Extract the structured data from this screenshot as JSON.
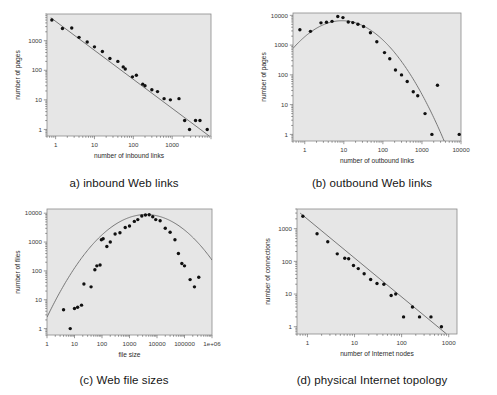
{
  "figure": {
    "background": "#ffffff",
    "plot_background": "#e6e6e6",
    "frame_color": "#8a8a8a",
    "point_color": "#101010",
    "curve_color": "#6b6b6b"
  },
  "panels": {
    "a": {
      "caption": "a) inbound Web links"
    },
    "b": {
      "caption": "(b) outbound Web links"
    },
    "c": {
      "caption": "(c) Web file sizes"
    },
    "d": {
      "caption": "(d) physical Internet topology"
    }
  },
  "chart_data": [
    {
      "id": "a",
      "type": "scatter",
      "title": "a) inbound Web links",
      "xlabel": "number of inbound links",
      "ylabel": "number of pages",
      "xscale": "log",
      "yscale": "log",
      "xlim": [
        0.6,
        10000
      ],
      "ylim": [
        0.6,
        8000
      ],
      "xticks": [
        1,
        10,
        100,
        1000
      ],
      "xticklabels": [
        "1",
        "10",
        "100",
        "1000"
      ],
      "yticks": [
        1,
        10,
        100,
        1000
      ],
      "yticklabels": [
        "1",
        "10",
        "100",
        "1000"
      ],
      "grid": false,
      "legend": "none",
      "points": [
        [
          0.8,
          5000
        ],
        [
          1.5,
          2600
        ],
        [
          2.6,
          2700
        ],
        [
          4.0,
          1300
        ],
        [
          6.5,
          900
        ],
        [
          10,
          620
        ],
        [
          16,
          430
        ],
        [
          25,
          250
        ],
        [
          40,
          200
        ],
        [
          55,
          130
        ],
        [
          62,
          110
        ],
        [
          95,
          60
        ],
        [
          120,
          68
        ],
        [
          175,
          34
        ],
        [
          200,
          30
        ],
        [
          300,
          22
        ],
        [
          420,
          19
        ],
        [
          620,
          11
        ],
        [
          900,
          10
        ],
        [
          1500,
          11
        ],
        [
          2100,
          2
        ],
        [
          2800,
          1
        ],
        [
          4000,
          2
        ],
        [
          5200,
          2
        ],
        [
          8000,
          1
        ]
      ],
      "fit_curve": {
        "kind": "power_law",
        "description": "straight line on log-log axes",
        "from": [
          0.75,
          6000
        ],
        "to": [
          9000,
          0.6
        ]
      }
    },
    {
      "id": "b",
      "type": "scatter",
      "title": "(b) outbound Web links",
      "xlabel": "number of outbound links",
      "ylabel": "number of pages",
      "xscale": "log",
      "yscale": "log",
      "xlim": [
        0.5,
        10000
      ],
      "ylim": [
        0.6,
        12000
      ],
      "xticks": [
        1,
        10,
        100,
        1000,
        10000
      ],
      "xticklabels": [
        "1",
        "10",
        "100",
        "1000",
        "10000"
      ],
      "yticks": [
        1,
        10,
        100,
        1000,
        10000
      ],
      "yticklabels": [
        "1",
        "10",
        "100",
        "1000",
        "10000"
      ],
      "grid": false,
      "legend": "none",
      "points": [
        [
          0.75,
          3300
        ],
        [
          1.4,
          2900
        ],
        [
          2.6,
          5600
        ],
        [
          3.6,
          5900
        ],
        [
          5.0,
          6300
        ],
        [
          7.0,
          9200
        ],
        [
          9.5,
          8400
        ],
        [
          13,
          6000
        ],
        [
          17,
          5700
        ],
        [
          23,
          5000
        ],
        [
          32,
          4200
        ],
        [
          48,
          2600
        ],
        [
          70,
          1300
        ],
        [
          110,
          560
        ],
        [
          150,
          350
        ],
        [
          210,
          145
        ],
        [
          300,
          100
        ],
        [
          420,
          60
        ],
        [
          600,
          27
        ],
        [
          780,
          20
        ],
        [
          1200,
          5
        ],
        [
          1800,
          1
        ],
        [
          2500,
          45
        ],
        [
          9000,
          1
        ]
      ],
      "fit_curve": {
        "kind": "lognormal_like",
        "description": "smooth hump peaking near x=9",
        "peak_x": 9,
        "peak_y": 6600
      }
    },
    {
      "id": "c",
      "type": "scatter",
      "title": "(c) Web file sizes",
      "xlabel": "file size",
      "ylabel": "number of files",
      "xscale": "log",
      "yscale": "log",
      "xlim": [
        1,
        1000000
      ],
      "ylim": [
        0.6,
        14000
      ],
      "xticks": [
        1,
        10,
        100,
        1000,
        10000,
        100000,
        1000000
      ],
      "xticklabels": [
        "1",
        "10",
        "100",
        "1000",
        "10000",
        "100000",
        "1e+06"
      ],
      "yticks": [
        1,
        10,
        100,
        1000,
        10000
      ],
      "yticklabels": [
        "1",
        "10",
        "100",
        "1000",
        "10000"
      ],
      "grid": false,
      "legend": "none",
      "points": [
        [
          4,
          4.5
        ],
        [
          7,
          1
        ],
        [
          10,
          5
        ],
        [
          13,
          5.5
        ],
        [
          18,
          6.5
        ],
        [
          22,
          35
        ],
        [
          40,
          28
        ],
        [
          55,
          110
        ],
        [
          65,
          150
        ],
        [
          85,
          160
        ],
        [
          95,
          1200
        ],
        [
          110,
          1300
        ],
        [
          150,
          700
        ],
        [
          200,
          1000
        ],
        [
          300,
          1900
        ],
        [
          450,
          2100
        ],
        [
          700,
          3200
        ],
        [
          1000,
          3600
        ],
        [
          1500,
          5200
        ],
        [
          2000,
          6000
        ],
        [
          2800,
          8000
        ],
        [
          3800,
          8700
        ],
        [
          5200,
          8900
        ],
        [
          7000,
          7500
        ],
        [
          9000,
          6000
        ],
        [
          13000,
          5500
        ],
        [
          20000,
          3000
        ],
        [
          30000,
          2200
        ],
        [
          45000,
          1200
        ],
        [
          60000,
          400
        ],
        [
          80000,
          180
        ],
        [
          100000,
          150
        ],
        [
          160000,
          50
        ],
        [
          230000,
          28
        ],
        [
          330000,
          60
        ]
      ],
      "fit_curve": {
        "kind": "lognormal_like",
        "description": "smooth hump peaking near x=4000",
        "peak_x": 4000,
        "peak_y": 9000
      }
    },
    {
      "id": "d",
      "type": "scatter",
      "title": "(d) physical Internet topology",
      "xlabel": "number of Internet nodes",
      "ylabel": "number of connections",
      "xscale": "log",
      "yscale": "log",
      "xlim": [
        0.6,
        1500
      ],
      "ylim": [
        0.6,
        4000
      ],
      "xticks": [
        1,
        10,
        100,
        1000
      ],
      "xticklabels": [
        "1",
        "10",
        "100",
        "1000"
      ],
      "yticks": [
        1,
        10,
        100,
        1000
      ],
      "yticklabels": [
        "1",
        "10",
        "100",
        "1000"
      ],
      "grid": false,
      "legend": "none",
      "points": [
        [
          0.8,
          2400
        ],
        [
          1.6,
          700
        ],
        [
          2.7,
          400
        ],
        [
          4.3,
          170
        ],
        [
          6.2,
          125
        ],
        [
          7.5,
          120
        ],
        [
          9.5,
          75
        ],
        [
          12,
          60
        ],
        [
          16,
          42
        ],
        [
          22,
          28
        ],
        [
          30,
          21
        ],
        [
          42,
          20
        ],
        [
          60,
          9
        ],
        [
          75,
          10
        ],
        [
          110,
          2
        ],
        [
          170,
          4
        ],
        [
          240,
          2
        ],
        [
          420,
          2
        ],
        [
          700,
          1
        ]
      ],
      "fit_curve": {
        "kind": "power_law",
        "description": "straight line on log-log axes",
        "from": [
          0.7,
          3000
        ],
        "to": [
          900,
          0.6
        ]
      }
    }
  ]
}
